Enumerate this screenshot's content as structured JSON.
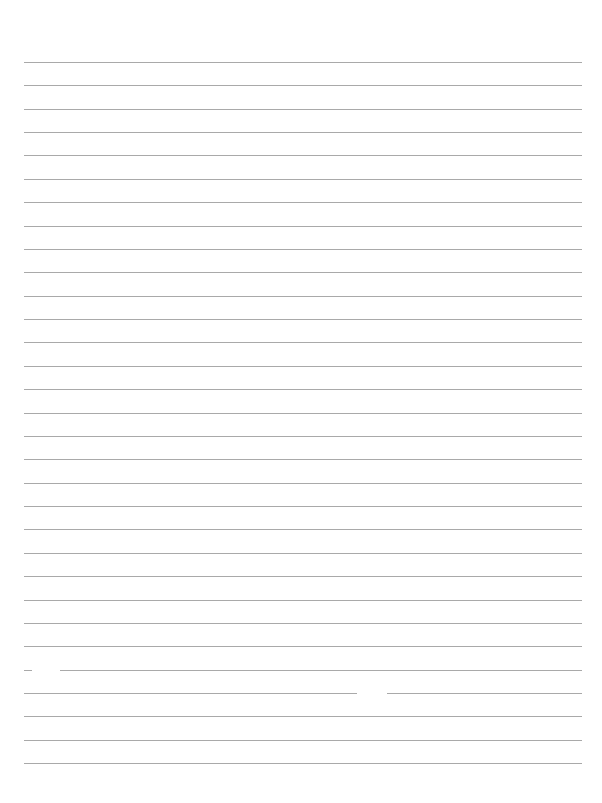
{
  "page": {
    "type": "lined-paper",
    "background_color": "#ffffff",
    "line_color": "#9a9a9a",
    "line_count": 31,
    "first_line_y": 62,
    "line_spacing": 23.37,
    "line_left_x": 24,
    "line_right_x": 582,
    "text_content": ""
  }
}
